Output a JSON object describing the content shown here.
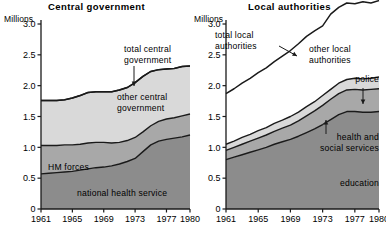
{
  "units_label": "Millions",
  "charts": [
    {
      "id": "central-government",
      "title": "Central government",
      "yticks": [
        "0",
        "0.5",
        "1.0",
        "1.5",
        "2.0",
        "2.5",
        "3.0"
      ],
      "ytick_values": [
        0,
        0.5,
        1.0,
        1.5,
        2.0,
        2.5,
        3.0
      ],
      "xticks": [
        "1961",
        "1965",
        "1969",
        "1973",
        "1977",
        "1980"
      ],
      "xtick_values": [
        1961,
        1965,
        1969,
        1973,
        1977,
        1980
      ],
      "annotations": [
        {
          "name": "total-central-government",
          "lines": [
            "total central",
            "government"
          ]
        },
        {
          "name": "other-central-government",
          "lines": [
            "other central",
            "government"
          ]
        },
        {
          "name": "hm-forces",
          "lines": [
            "HM forces"
          ]
        },
        {
          "name": "national-health-service",
          "lines": [
            "national health service"
          ]
        }
      ]
    },
    {
      "id": "local-authorities",
      "title": "Local authorities",
      "yticks": [
        "0",
        "0.5",
        "1.0",
        "1.5",
        "2.0",
        "2.5",
        "3.0"
      ],
      "ytick_values": [
        0,
        0.5,
        1.0,
        1.5,
        2.0,
        2.5,
        3.0
      ],
      "xticks": [
        "1961",
        "1965",
        "1969",
        "1973",
        "1977",
        "1980"
      ],
      "xtick_values": [
        1961,
        1965,
        1969,
        1973,
        1977,
        1980
      ],
      "annotations": [
        {
          "name": "total-local-authorities",
          "lines": [
            "total local",
            "authorities"
          ]
        },
        {
          "name": "other-local-authorities",
          "lines": [
            "other local",
            "authorities"
          ]
        },
        {
          "name": "police",
          "lines": [
            "police"
          ]
        },
        {
          "name": "health-and-social-services",
          "lines": [
            "health and",
            "social services"
          ]
        },
        {
          "name": "education",
          "lines": [
            "education"
          ]
        }
      ]
    }
  ],
  "colors": {
    "dark": "#8c8c8c",
    "mid": "#a8a8a8",
    "light": "#d9d9d9",
    "white": "#ffffff",
    "line": "#1a1a1a"
  },
  "chart_data": [
    {
      "type": "area",
      "stacked": true,
      "title": "Central government",
      "xlabel": "",
      "ylabel": "Millions",
      "xlim": [
        1961,
        1980
      ],
      "ylim": [
        0,
        3.0
      ],
      "grid": false,
      "legend": "annotations-inline",
      "x": [
        1961,
        1962,
        1963,
        1964,
        1965,
        1966,
        1967,
        1968,
        1969,
        1970,
        1971,
        1972,
        1973,
        1974,
        1975,
        1976,
        1977,
        1978,
        1979,
        1980
      ],
      "series": [
        {
          "name": "national health service",
          "values": [
            0.57,
            0.58,
            0.59,
            0.6,
            0.61,
            0.63,
            0.65,
            0.67,
            0.68,
            0.7,
            0.73,
            0.77,
            0.82,
            0.93,
            1.04,
            1.1,
            1.13,
            1.15,
            1.17,
            1.2
          ]
        },
        {
          "name": "HM forces",
          "values": [
            0.46,
            0.45,
            0.44,
            0.44,
            0.43,
            0.42,
            0.42,
            0.41,
            0.4,
            0.37,
            0.35,
            0.34,
            0.34,
            0.32,
            0.31,
            0.32,
            0.33,
            0.33,
            0.34,
            0.34
          ]
        },
        {
          "name": "other central government",
          "values": [
            0.73,
            0.73,
            0.73,
            0.73,
            0.76,
            0.79,
            0.82,
            0.82,
            0.82,
            0.83,
            0.85,
            0.86,
            0.89,
            0.9,
            0.88,
            0.84,
            0.81,
            0.8,
            0.8,
            0.78
          ]
        }
      ],
      "totals": {
        "name": "total central government",
        "values": [
          1.76,
          1.76,
          1.76,
          1.77,
          1.8,
          1.84,
          1.89,
          1.9,
          1.9,
          1.9,
          1.93,
          1.97,
          2.05,
          2.15,
          2.23,
          2.26,
          2.27,
          2.28,
          2.31,
          2.32
        ]
      }
    },
    {
      "type": "area",
      "stacked": true,
      "title": "Local authorities",
      "xlabel": "",
      "ylabel": "Millions",
      "xlim": [
        1961,
        1980
      ],
      "ylim": [
        0,
        3.0
      ],
      "grid": false,
      "legend": "annotations-inline",
      "x": [
        1961,
        1962,
        1963,
        1964,
        1965,
        1966,
        1967,
        1968,
        1969,
        1970,
        1971,
        1972,
        1973,
        1974,
        1975,
        1976,
        1977,
        1978,
        1979,
        1980
      ],
      "series": [
        {
          "name": "education",
          "values": [
            0.8,
            0.84,
            0.88,
            0.92,
            0.96,
            1.0,
            1.05,
            1.09,
            1.13,
            1.18,
            1.24,
            1.3,
            1.37,
            1.45,
            1.53,
            1.58,
            1.58,
            1.57,
            1.57,
            1.58
          ]
        },
        {
          "name": "health and social services",
          "values": [
            0.15,
            0.16,
            0.17,
            0.18,
            0.19,
            0.2,
            0.21,
            0.22,
            0.23,
            0.25,
            0.27,
            0.29,
            0.31,
            0.33,
            0.34,
            0.35,
            0.36,
            0.36,
            0.37,
            0.37
          ]
        },
        {
          "name": "police",
          "values": [
            0.1,
            0.1,
            0.11,
            0.11,
            0.12,
            0.12,
            0.13,
            0.13,
            0.14,
            0.14,
            0.15,
            0.15,
            0.16,
            0.16,
            0.17,
            0.17,
            0.18,
            0.18,
            0.18,
            0.19
          ]
        },
        {
          "name": "other local authorities",
          "values": [
            0.82,
            0.85,
            0.88,
            0.91,
            0.94,
            0.97,
            1.0,
            1.04,
            1.07,
            1.11,
            1.14,
            1.15,
            1.13,
            1.22,
            1.23,
            1.24,
            1.21,
            1.25,
            1.22,
            1.24
          ]
        }
      ],
      "totals": {
        "name": "total local authorities",
        "values": [
          1.87,
          1.95,
          2.04,
          2.12,
          2.21,
          2.29,
          2.39,
          2.48,
          2.57,
          2.68,
          2.8,
          2.89,
          2.97,
          3.16,
          3.27,
          3.34,
          3.33,
          3.36,
          3.34,
          3.38
        ]
      }
    }
  ]
}
